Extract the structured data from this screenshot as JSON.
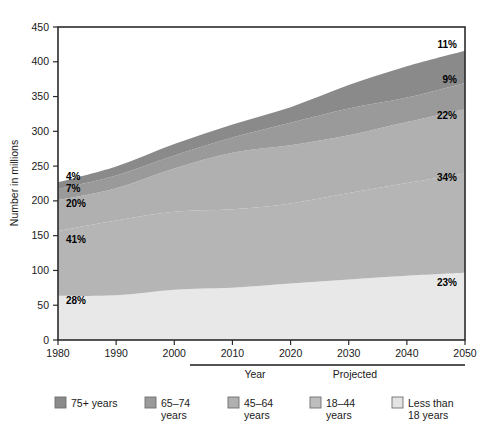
{
  "chart_data": {
    "type": "area",
    "title": "",
    "xlabel": "Year",
    "ylabel": "Number in millions",
    "xlim": [
      1980,
      2050
    ],
    "ylim": [
      0,
      450
    ],
    "grid": false,
    "legend_position": "bottom",
    "stacked": true,
    "x": [
      1980,
      1990,
      2000,
      2010,
      2020,
      2030,
      2040,
      2050
    ],
    "xticks": [
      "1980",
      "1990",
      "2000",
      "2010",
      "2020",
      "2030",
      "2040",
      "2050"
    ],
    "yticks": [
      "0",
      "50",
      "100",
      "150",
      "200",
      "250",
      "300",
      "350",
      "400",
      "450"
    ],
    "series": [
      {
        "name": "Less than 18 years",
        "color": "#e8e8e8",
        "values": [
          63.6,
          64.2,
          72.3,
          75.0,
          81.1,
          87.0,
          92.3,
          96.6
        ]
      },
      {
        "name": "18–44 years",
        "color": "#b5b5b5",
        "values": [
          93.1,
          107.7,
          112.0,
          112.8,
          115.3,
          124.4,
          133.3,
          142.8
        ]
      },
      {
        "name": "45–64 years",
        "color": "#b0b0b0",
        "values": [
          44.5,
          46.4,
          62.4,
          81.5,
          83.6,
          82.8,
          87.7,
          92.4
        ]
      },
      {
        "name": "65–74 years",
        "color": "#9a9a9a",
        "values": [
          15.6,
          18.1,
          18.4,
          21.7,
          32.3,
          38.6,
          35.2,
          37.8
        ]
      },
      {
        "name": "75+ years",
        "color": "#8a8a8a",
        "values": [
          9.9,
          13.1,
          16.6,
          18.8,
          22.4,
          33.7,
          44.9,
          46.2
        ]
      }
    ],
    "annotations_left": [
      {
        "text": "4%",
        "series": "75+ years"
      },
      {
        "text": "7%",
        "series": "65–74 years"
      },
      {
        "text": "20%",
        "series": "45–64 years"
      },
      {
        "text": "41%",
        "series": "18–44 years"
      },
      {
        "text": "28%",
        "series": "Less than 18 years"
      }
    ],
    "annotations_right": [
      {
        "text": "11%",
        "series": "75+ years"
      },
      {
        "text": "9%",
        "series": "65–74 years"
      },
      {
        "text": "22%",
        "series": "45–64 years"
      },
      {
        "text": "34%",
        "series": "18–44 years"
      },
      {
        "text": "23%",
        "series": "Less than 18 years"
      }
    ],
    "projected_label": "Projected",
    "projected_start_year": 2007
  },
  "axes": {
    "ylabel": "Number in millions",
    "xlabel": "Year",
    "yticks": [
      "450",
      "400",
      "350",
      "300",
      "250",
      "200",
      "150",
      "100",
      "50",
      "0"
    ],
    "xticks": [
      "1980",
      "1990",
      "2000",
      "2010",
      "2020",
      "2030",
      "2040",
      "2050"
    ]
  },
  "annotations": {
    "left": [
      "4%",
      "7%",
      "20%",
      "41%",
      "28%"
    ],
    "right": [
      "11%",
      "9%",
      "22%",
      "34%",
      "23%"
    ],
    "projected": "Projected"
  },
  "legend": {
    "items": [
      {
        "label_line1": "75+ years",
        "label_line2": "",
        "color": "#8a8a8a"
      },
      {
        "label_line1": "65–74",
        "label_line2": "years",
        "color": "#9a9a9a"
      },
      {
        "label_line1": "45–64",
        "label_line2": "years",
        "color": "#b0b0b0"
      },
      {
        "label_line1": "18–44",
        "label_line2": "years",
        "color": "#bdbdbd"
      },
      {
        "label_line1": "Less than",
        "label_line2": "18 years",
        "color": "#e3e3e3"
      }
    ]
  }
}
